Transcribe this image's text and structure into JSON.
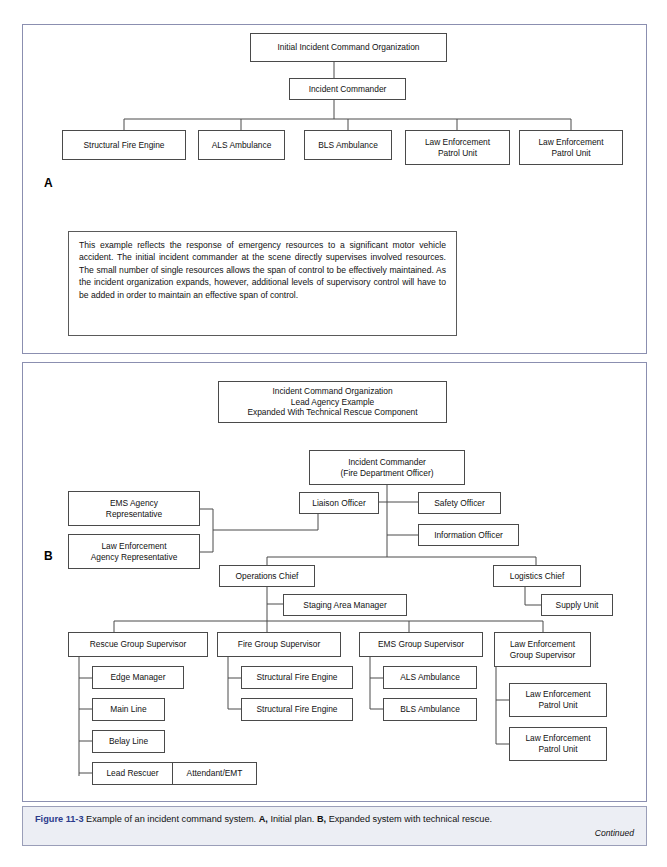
{
  "panel_a": {
    "letter": "A",
    "nodes": {
      "root": "Initial Incident Command Organization",
      "commander": "Incident Commander",
      "unit1": "Structural Fire Engine",
      "unit2": "ALS Ambulance",
      "unit3": "BLS Ambulance",
      "unit4": "Law Enforcement\nPatrol Unit",
      "unit5": "Law Enforcement\nPatrol Unit"
    },
    "description": "This example reflects the response of emergency resources to a significant motor vehicle accident. The initial incident commander at the scene directly supervises involved resources. The small number of single resources allows the span of control to be effectively maintained. As the incident organization expands, however, additional levels of supervisory control will have to be added in order to maintain an effective span of control."
  },
  "panel_b": {
    "letter": "B",
    "nodes": {
      "title": "Incident Command Organization\nLead Agency Example\nExpanded With Technical Rescue Component",
      "commander": "Incident Commander\n(Fire Department Officer)",
      "liaison": "Liaison Officer",
      "safety": "Safety Officer",
      "information": "Information Officer",
      "ems_rep": "EMS Agency\nRepresentative",
      "le_rep": "Law Enforcement\nAgency Representative",
      "operations": "Operations Chief",
      "logistics": "Logistics Chief",
      "staging": "Staging Area Manager",
      "supply": "Supply Unit",
      "rescue_group": "Rescue Group Supervisor",
      "fire_group": "Fire Group Supervisor",
      "ems_group": "EMS Group Supervisor",
      "le_group": "Law Enforcement\nGroup Supervisor",
      "edge_manager": "Edge Manager",
      "main_line": "Main Line",
      "belay_line": "Belay Line",
      "lead_rescuer": "Lead Rescuer",
      "attendant": "Attendant/EMT",
      "fire_engine_1": "Structural Fire Engine",
      "fire_engine_2": "Structural Fire Engine",
      "als_ambulance": "ALS Ambulance",
      "bls_ambulance": "BLS Ambulance",
      "le_patrol_1": "Law Enforcement\nPatrol Unit",
      "le_patrol_2": "Law Enforcement\nPatrol Unit"
    }
  },
  "caption": {
    "figure_number": "Figure 11-3",
    "text_1": " Example of an incident command system. ",
    "label_a": "A,",
    "text_2": " Initial plan. ",
    "label_b": "B,",
    "text_3": " Expanded system with technical rescue.",
    "continued": "Continued"
  },
  "colors": {
    "panel_border": "#8b8fb0",
    "node_border": "#4a4a4a",
    "caption_accent": "#2b3a8c",
    "caption_bg": "#eceef4"
  }
}
